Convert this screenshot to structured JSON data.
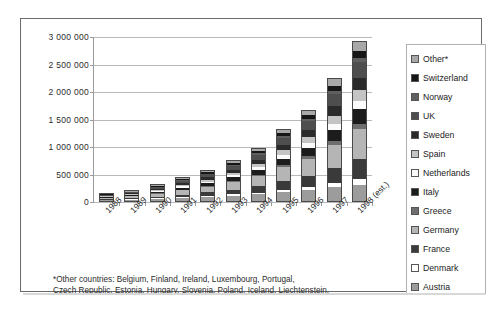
{
  "chart_data": {
    "type": "bar",
    "stacked": true,
    "title": "",
    "xlabel": "",
    "ylabel": "",
    "ylim": [
      0,
      3000000
    ],
    "ytick_step": 500000,
    "ytick_labels": [
      "3 000 000",
      "2 500 000",
      "2 000 000",
      "1 500 000",
      "1 000 000",
      "500 000",
      "0"
    ],
    "ytick_values": [
      3000000,
      2500000,
      2000000,
      1500000,
      1000000,
      500000,
      0
    ],
    "grid": true,
    "legend_position": "right",
    "categories": [
      "1988",
      "1989",
      "1990",
      "1991",
      "1992",
      "1993",
      "1994",
      "1995",
      "1996",
      "1997",
      "1998 (est.)"
    ],
    "totals": [
      160000,
      215000,
      320000,
      450000,
      580000,
      760000,
      980000,
      1330000,
      1680000,
      2250000,
      2920000
    ],
    "series": [
      {
        "name": "Austria",
        "color": "#9c9c9c",
        "values": [
          22000,
          30000,
          42000,
          58000,
          75000,
          96000,
          122000,
          165000,
          205000,
          250000,
          300000
        ]
      },
      {
        "name": "Denmark",
        "color": "#ffffff",
        "values": [
          6000,
          8000,
          11000,
          16000,
          21000,
          27000,
          35000,
          46000,
          58000,
          72000,
          95000
        ]
      },
      {
        "name": "France",
        "color": "#3a3a3a",
        "values": [
          18000,
          24000,
          36000,
          52000,
          68000,
          90000,
          118000,
          160000,
          205000,
          280000,
          370000
        ]
      },
      {
        "name": "Germany",
        "color": "#b5b5b5",
        "values": [
          30000,
          40000,
          60000,
          85000,
          110000,
          145000,
          190000,
          255000,
          320000,
          430000,
          560000
        ]
      },
      {
        "name": "Greece",
        "color": "#6e6e6e",
        "values": [
          5000,
          7000,
          10000,
          14000,
          18000,
          24000,
          31000,
          42000,
          53000,
          70000,
          90000
        ]
      },
      {
        "name": "Italy",
        "color": "#1c1c1c",
        "values": [
          14000,
          19000,
          28000,
          40000,
          52000,
          68000,
          88000,
          120000,
          152000,
          205000,
          270000
        ]
      },
      {
        "name": "Netherlands",
        "color": "#fbfbfb",
        "values": [
          8000,
          11000,
          16000,
          22000,
          29000,
          38000,
          49000,
          66000,
          84000,
          112000,
          148000
        ]
      },
      {
        "name": "Spain",
        "color": "#c4c4c4",
        "values": [
          11000,
          15000,
          22000,
          31000,
          40000,
          53000,
          68000,
          92000,
          116000,
          156000,
          205000
        ]
      },
      {
        "name": "Sweden",
        "color": "#2a2a2a",
        "values": [
          13000,
          17000,
          25000,
          35000,
          45000,
          59000,
          77000,
          104000,
          131000,
          176000,
          230000
        ]
      },
      {
        "name": "UK",
        "color": "#4e4e4e",
        "values": [
          16000,
          21000,
          31000,
          44000,
          57000,
          75000,
          97000,
          131000,
          166000,
          222000,
          290000
        ]
      },
      {
        "name": "Norway",
        "color": "#5f5f5f",
        "values": [
          4000,
          6000,
          8000,
          11000,
          15000,
          19000,
          25000,
          34000,
          42000,
          57000,
          74000
        ]
      },
      {
        "name": "Switzerland",
        "color": "#161616",
        "values": [
          7000,
          9000,
          13000,
          19000,
          24000,
          32000,
          41000,
          56000,
          70000,
          94000,
          123000
        ]
      },
      {
        "name": "Other*",
        "color": "#a8a8a8",
        "values": [
          6000,
          8000,
          18000,
          23000,
          26000,
          34000,
          39000,
          59000,
          78000,
          126000,
          165000
        ]
      }
    ]
  },
  "legend": {
    "items": [
      {
        "label": "Other*",
        "color": "#a8a8a8"
      },
      {
        "label": "Switzerland",
        "color": "#161616"
      },
      {
        "label": "Norway",
        "color": "#5f5f5f"
      },
      {
        "label": "UK",
        "color": "#4e4e4e"
      },
      {
        "label": "Sweden",
        "color": "#2a2a2a"
      },
      {
        "label": "Spain",
        "color": "#c4c4c4"
      },
      {
        "label": "Netherlands",
        "color": "#fbfbfb"
      },
      {
        "label": "Italy",
        "color": "#1c1c1c"
      },
      {
        "label": "Greece",
        "color": "#6e6e6e"
      },
      {
        "label": "Germany",
        "color": "#b5b5b5"
      },
      {
        "label": "France",
        "color": "#3a3a3a"
      },
      {
        "label": "Denmark",
        "color": "#ffffff"
      },
      {
        "label": "Austria",
        "color": "#9c9c9c"
      }
    ]
  },
  "footnote": {
    "line1": "*Other countries: Belgium, Finland, Ireland, Luxembourg, Portugal,",
    "line2": "Czech Republic, Estonia, Hungary, Slovenia, Poland, Iceland, Liechtenstein."
  }
}
